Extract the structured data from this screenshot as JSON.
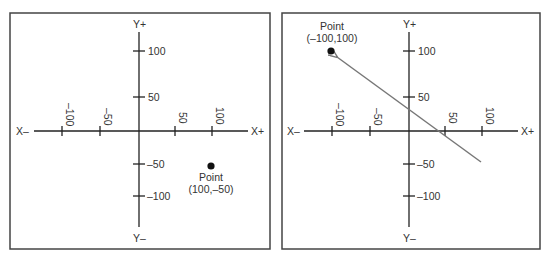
{
  "panels": [
    {
      "id": "left",
      "axis_labels": {
        "x_neg": "X–",
        "x_pos": "X+",
        "y_pos": "Y+",
        "y_neg": "Y–"
      },
      "x_ticks": [
        "–100",
        "–50",
        "50",
        "100"
      ],
      "y_ticks": [
        "100",
        "50",
        "–50",
        "–100"
      ],
      "point": {
        "title": "Point",
        "coords": "(100,–50)"
      }
    },
    {
      "id": "right",
      "axis_labels": {
        "x_neg": "X–",
        "x_pos": "X+",
        "y_pos": "Y+",
        "y_neg": "Y–"
      },
      "x_ticks": [
        "–100",
        "–50",
        "50",
        "100"
      ],
      "y_ticks": [
        "100",
        "50",
        "–50",
        "–100"
      ],
      "point": {
        "title": "Point",
        "coords": "(–100,100)"
      },
      "arrow": "from (100,–50) toward point (–100,100)"
    }
  ],
  "colors": {
    "border": "#444444",
    "axis": "#222222",
    "arrow": "#777777",
    "point": "#111111"
  }
}
